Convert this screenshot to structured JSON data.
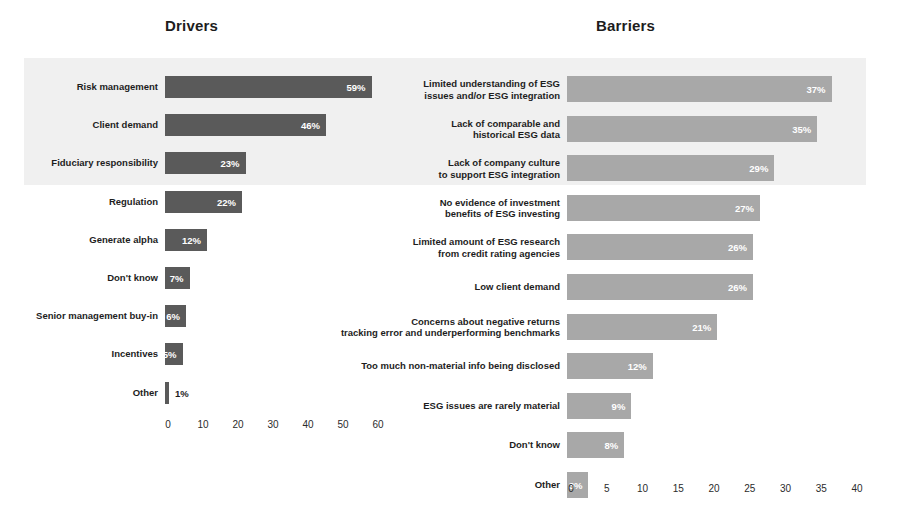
{
  "chart_data": [
    {
      "type": "bar",
      "title": "Drivers",
      "orientation": "horizontal",
      "xlabel": "",
      "ylabel": "",
      "xlim": [
        0,
        65
      ],
      "xticks": [
        0,
        10,
        20,
        30,
        40,
        50,
        60
      ],
      "grid": false,
      "legend": "none",
      "bar_color": "#5a5a5a",
      "highlight_band_color": "#f0f0f0",
      "highlighted_categories": [
        "Risk management",
        "Client demand",
        "Fiduciary responsibility"
      ],
      "categories": [
        "Risk management",
        "Client demand",
        "Fiduciary responsibility",
        "Regulation",
        "Generate alpha",
        "Don't know",
        "Senior management buy-in",
        "Incentives",
        "Other"
      ],
      "values": [
        59,
        46,
        23,
        22,
        12,
        7,
        6,
        5,
        1
      ],
      "data_labels": [
        "59%",
        "46%",
        "23%",
        "22%",
        "12%",
        "7%",
        "6%",
        "5%",
        "1%"
      ]
    },
    {
      "type": "bar",
      "title": "Barriers",
      "orientation": "horizontal",
      "xlabel": "",
      "ylabel": "",
      "xlim": [
        0,
        41
      ],
      "xticks": [
        0,
        5,
        10,
        15,
        20,
        25,
        30,
        35,
        40
      ],
      "grid": false,
      "legend": "none",
      "bar_color": "#a8a8a8",
      "highlight_band_color": "#f0f0f0",
      "highlighted_categories": [
        "Limited understanding of ESG issues and/or ESG integration",
        "Lack of comparable and historical ESG data",
        "Lack of company culture to support ESG integration"
      ],
      "categories": [
        "Limited understanding of ESG\nissues and/or ESG integration",
        "Lack of comparable and\nhistorical ESG data",
        "Lack of company culture\nto support ESG integration",
        "No evidence of investment\nbenefits of ESG investing",
        "Limited amount of ESG research\nfrom credit rating agencies",
        "Low client demand",
        "Concerns about negative returns\ntracking error and underperforming benchmarks",
        "Too much non-material info being disclosed",
        "ESG issues are rarely material",
        "Don't know",
        "Other"
      ],
      "values": [
        37,
        35,
        29,
        27,
        26,
        26,
        21,
        12,
        9,
        8,
        3
      ],
      "data_labels": [
        "37%",
        "35%",
        "29%",
        "27%",
        "26%",
        "26%",
        "21%",
        "12%",
        "9%",
        "8%",
        "3%"
      ]
    }
  ],
  "drivers": {
    "title": "Drivers",
    "rows": [
      {
        "label_line1": "Risk management",
        "label_line2": "",
        "value_label": "59%"
      },
      {
        "label_line1": "Client demand",
        "label_line2": "",
        "value_label": "46%"
      },
      {
        "label_line1": "Fiduciary responsibility",
        "label_line2": "",
        "value_label": "23%"
      },
      {
        "label_line1": "Regulation",
        "label_line2": "",
        "value_label": "22%"
      },
      {
        "label_line1": "Generate alpha",
        "label_line2": "",
        "value_label": "12%"
      },
      {
        "label_line1": "Don't know",
        "label_line2": "",
        "value_label": "7%"
      },
      {
        "label_line1": "Senior management buy-in",
        "label_line2": "",
        "value_label": "6%"
      },
      {
        "label_line1": "Incentives",
        "label_line2": "",
        "value_label": "5%"
      },
      {
        "label_line1": "Other",
        "label_line2": "",
        "value_label": "1%"
      }
    ],
    "axis": {
      "ticks": [
        "0",
        "10",
        "20",
        "30",
        "40",
        "50",
        "60"
      ]
    }
  },
  "barriers": {
    "title": "Barriers",
    "rows": [
      {
        "label_line1": "Limited understanding of ESG",
        "label_line2": "issues and/or ESG integration",
        "value_label": "37%"
      },
      {
        "label_line1": "Lack of comparable and",
        "label_line2": "historical ESG data",
        "value_label": "35%"
      },
      {
        "label_line1": "Lack of company culture",
        "label_line2": "to support ESG integration",
        "value_label": "29%"
      },
      {
        "label_line1": "No evidence of investment",
        "label_line2": "benefits of ESG investing",
        "value_label": "27%"
      },
      {
        "label_line1": "Limited amount of ESG research",
        "label_line2": "from credit rating agencies",
        "value_label": "26%"
      },
      {
        "label_line1": "Low client demand",
        "label_line2": "",
        "value_label": "26%"
      },
      {
        "label_line1": "Concerns about negative returns",
        "label_line2": "tracking error and underperforming benchmarks",
        "value_label": "21%"
      },
      {
        "label_line1": "Too much non-material info being disclosed",
        "label_line2": "",
        "value_label": "12%"
      },
      {
        "label_line1": "ESG issues are rarely material",
        "label_line2": "",
        "value_label": "9%"
      },
      {
        "label_line1": "Don't know",
        "label_line2": "",
        "value_label": "8%"
      },
      {
        "label_line1": "Other",
        "label_line2": "",
        "value_label": "3%"
      }
    ],
    "axis": {
      "ticks": [
        "0",
        "5",
        "10",
        "15",
        "20",
        "25",
        "30",
        "35",
        "40"
      ]
    }
  }
}
